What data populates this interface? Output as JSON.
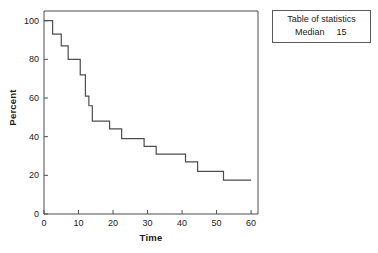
{
  "chart_data": {
    "type": "line",
    "subtype": "kaplan-meier-step",
    "title": "",
    "xlabel": "Time",
    "ylabel": "Percent",
    "xlim": [
      0,
      62
    ],
    "ylim": [
      0,
      105
    ],
    "xticks": [
      0,
      10,
      20,
      30,
      40,
      50,
      60
    ],
    "xtick_labels": [
      "0",
      "10",
      "20",
      "30",
      "40",
      "50",
      "60"
    ],
    "yticks": [
      0,
      20,
      40,
      60,
      80,
      100
    ],
    "ytick_labels": [
      "0",
      "20",
      "40",
      "60",
      "80",
      "100"
    ],
    "grid": false,
    "legend": false,
    "line_color": "#4d4d4d",
    "line_width": 1.2,
    "series": [
      {
        "name": "Survival",
        "step": "post",
        "x": [
          0,
          2.5,
          5,
          7,
          9,
          10.5,
          12,
          13,
          14,
          15,
          19,
          22.5,
          26,
          29,
          32.5,
          36,
          41,
          44.5,
          48,
          52,
          60
        ],
        "y": [
          100,
          100,
          93,
          87,
          80,
          80,
          72,
          61,
          56,
          48,
          48,
          44,
          39,
          39,
          35,
          31,
          31,
          27,
          22,
          22,
          17.5
        ]
      }
    ],
    "steps": [
      {
        "time": 0,
        "percent": 100
      },
      {
        "time": 2.5,
        "percent": 100
      },
      {
        "time": 2.5,
        "percent": 93
      },
      {
        "time": 5,
        "percent": 93
      },
      {
        "time": 5,
        "percent": 87
      },
      {
        "time": 7,
        "percent": 87
      },
      {
        "time": 7,
        "percent": 80
      },
      {
        "time": 10.5,
        "percent": 80
      },
      {
        "time": 10.5,
        "percent": 72
      },
      {
        "time": 12,
        "percent": 72
      },
      {
        "time": 12,
        "percent": 61
      },
      {
        "time": 13,
        "percent": 61
      },
      {
        "time": 13,
        "percent": 56
      },
      {
        "time": 14,
        "percent": 56
      },
      {
        "time": 14,
        "percent": 48
      },
      {
        "time": 19,
        "percent": 48
      },
      {
        "time": 19,
        "percent": 44
      },
      {
        "time": 22.5,
        "percent": 44
      },
      {
        "time": 22.5,
        "percent": 39
      },
      {
        "time": 29,
        "percent": 39
      },
      {
        "time": 29,
        "percent": 35
      },
      {
        "time": 32.5,
        "percent": 35
      },
      {
        "time": 32.5,
        "percent": 31
      },
      {
        "time": 41,
        "percent": 31
      },
      {
        "time": 41,
        "percent": 27
      },
      {
        "time": 44.5,
        "percent": 27
      },
      {
        "time": 44.5,
        "percent": 22
      },
      {
        "time": 52,
        "percent": 22
      },
      {
        "time": 52,
        "percent": 17.5
      },
      {
        "time": 60,
        "percent": 17.5
      }
    ]
  },
  "stats_table": {
    "title": "Table of statistics",
    "rows": [
      {
        "label": "Median",
        "value": "15"
      }
    ]
  }
}
